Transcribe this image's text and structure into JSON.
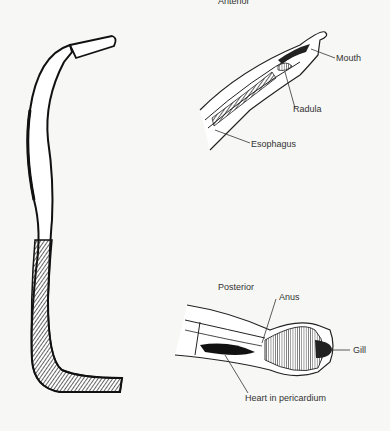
{
  "figure": {
    "whole_body": {
      "name": "Scaphopod-like worm mollusk (whole animal)"
    },
    "anterior": {
      "title": "Anterior",
      "labels": [
        "Mouth",
        "Radula",
        "Esophagus"
      ]
    },
    "posterior": {
      "title": "Posterior",
      "labels": [
        "Anus",
        "Gill",
        "Heart in pericardium"
      ]
    }
  }
}
